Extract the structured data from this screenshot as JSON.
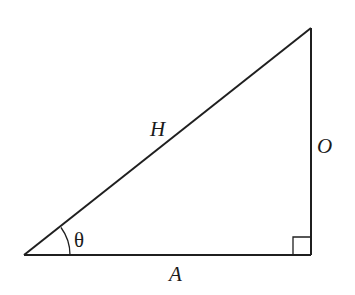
{
  "diagram": {
    "type": "right-triangle",
    "colors": {
      "stroke": "#1f1f1f",
      "background": "#ffffff"
    },
    "vertices": {
      "angle_vertex": [
        24,
        255
      ],
      "right_angle_vertex": [
        311,
        255
      ],
      "top_vertex": [
        311,
        28
      ]
    },
    "labels": {
      "hypotenuse": "H",
      "opposite": "O",
      "adjacent": "A",
      "angle": "θ"
    },
    "right_angle_marker": true
  }
}
